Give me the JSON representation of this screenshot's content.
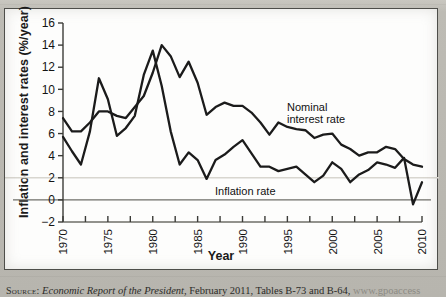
{
  "figure": {
    "axis_title_y": "Inflation and interest rates (%/year)",
    "axis_title_x": "Year",
    "annotation_nominal": "Nominal\ninterest rate",
    "annotation_inflation": "Inflation rate"
  },
  "source": {
    "prefix": "Source:",
    "italic_title": "Economic Report of the President",
    "rest": ", February 2011, Tables B-73 and B-64,",
    "url": "www.gpoaccess"
  },
  "chart_data": {
    "type": "line",
    "title": "",
    "xlabel": "Year",
    "ylabel": "Inflation and interest rates (%/year)",
    "xlim": [
      1970,
      2010
    ],
    "ylim": [
      -2,
      16
    ],
    "yticks": [
      -2,
      0,
      2,
      4,
      6,
      8,
      10,
      12,
      14,
      16
    ],
    "xticks": [
      1970,
      1972.5,
      1975,
      1977.5,
      1980,
      1982.5,
      1985,
      1987.5,
      1990,
      1992.5,
      1995,
      1997.5,
      2000,
      2002.5,
      2005,
      2007.5,
      2010
    ],
    "xtick_labels": [
      "1970",
      "",
      "1975",
      "",
      "1980",
      "",
      "1985",
      "",
      "1990",
      "",
      "1995",
      "",
      "2000",
      "",
      "2005",
      "",
      "2010"
    ],
    "grid": false,
    "legend_position": "inline-annotations",
    "x": [
      1970,
      1971,
      1972,
      1973,
      1974,
      1975,
      1976,
      1977,
      1978,
      1979,
      1980,
      1981,
      1982,
      1983,
      1984,
      1985,
      1986,
      1987,
      1988,
      1989,
      1990,
      1991,
      1992,
      1993,
      1994,
      1995,
      1996,
      1997,
      1998,
      1999,
      2000,
      2001,
      2002,
      2003,
      2004,
      2005,
      2006,
      2007,
      2008,
      2009,
      2010
    ],
    "series": [
      {
        "name": "Nominal interest rate",
        "values": [
          7.4,
          6.2,
          6.2,
          7.0,
          8.0,
          8.0,
          7.6,
          7.4,
          8.4,
          9.4,
          11.5,
          14.0,
          13.0,
          11.1,
          12.5,
          10.6,
          7.7,
          8.4,
          8.8,
          8.5,
          8.5,
          7.9,
          7.0,
          5.9,
          7.0,
          6.6,
          6.4,
          6.3,
          5.6,
          5.9,
          6.0,
          5.0,
          4.6,
          4.0,
          4.3,
          4.3,
          4.8,
          4.6,
          3.7,
          3.2,
          3.0
        ]
      },
      {
        "name": "Inflation rate",
        "values": [
          5.7,
          4.4,
          3.2,
          6.2,
          11.0,
          9.1,
          5.8,
          6.5,
          7.6,
          11.3,
          13.5,
          10.3,
          6.2,
          3.2,
          4.3,
          3.6,
          1.9,
          3.6,
          4.1,
          4.8,
          5.4,
          4.2,
          3.0,
          3.0,
          2.6,
          2.8,
          3.0,
          2.3,
          1.6,
          2.2,
          3.4,
          2.8,
          1.6,
          2.3,
          2.7,
          3.4,
          3.2,
          2.9,
          3.8,
          -0.4,
          1.6
        ]
      }
    ]
  }
}
